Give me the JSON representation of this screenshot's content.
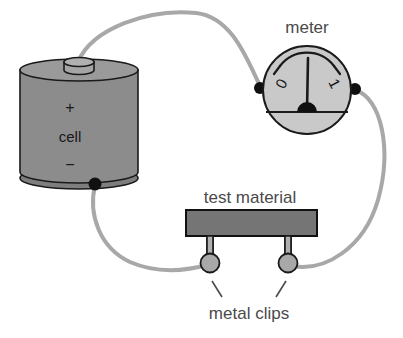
{
  "diagram": {
    "background_color": "#ffffff",
    "labels": {
      "meter": "meter",
      "test_material": "test material",
      "metal_clips": "metal clips",
      "cell": "cell",
      "plus_sign": "+",
      "minus_sign": "−"
    },
    "meter": {
      "scale_min_label": "0",
      "scale_max_label": "1",
      "face_color": "#c9c9c9",
      "outline_color": "#1a1a1a",
      "needle_color": "#1a1a1a",
      "terminal_color": "#101010"
    },
    "cell": {
      "body_color": "#8c8c8c",
      "top_color": "#9a9a9a",
      "outline_color": "#1a1a1a",
      "terminal_color": "#101010"
    },
    "test_material": {
      "bar_color": "#757575",
      "outline_color": "#111111"
    },
    "clips": {
      "stem_color": "#b0b0b0",
      "ball_color": "#a8a8a8",
      "outline_color": "#1a1a1a",
      "count": "2"
    },
    "wires": {
      "color": "#a8a8a8",
      "width": "4",
      "count": "3"
    },
    "leader_lines": {
      "color": "#4a4a4a",
      "count": "2"
    }
  }
}
